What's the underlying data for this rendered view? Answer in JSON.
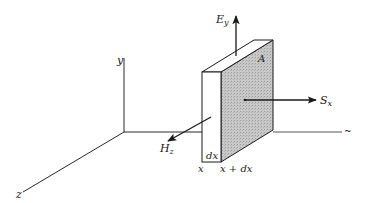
{
  "figure": {
    "type": "3d-slab-poynting-diagram",
    "axes": {
      "y_label": "y",
      "z_label": "z",
      "x_end_mark": "~"
    },
    "slab": {
      "face_label": "A",
      "thickness_label": "dx",
      "left_position_label": "x",
      "right_position_label": "x + dx",
      "shaded_face_color": "#c8c8c8",
      "front_face_color": "#ffffff"
    },
    "vectors": {
      "electric_field": {
        "symbol": "E",
        "subscript": "y"
      },
      "magnetic_field": {
        "symbol": "H",
        "subscript": "z"
      },
      "poynting": {
        "symbol": "S",
        "subscript": "x"
      }
    },
    "line_color": "#1a1a1a"
  }
}
